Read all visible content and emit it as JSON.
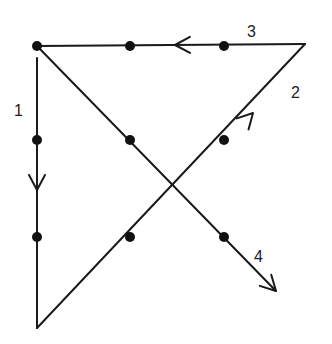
{
  "diagram": {
    "colors": {
      "line": "#1a1a1a",
      "dot": "#111111",
      "label": "#222222",
      "background": "#ffffff"
    },
    "dots": [
      {
        "x": 37,
        "y": 46
      },
      {
        "x": 130,
        "y": 46
      },
      {
        "x": 224,
        "y": 46
      },
      {
        "x": 37,
        "y": 140
      },
      {
        "x": 130,
        "y": 140
      },
      {
        "x": 224,
        "y": 140
      },
      {
        "x": 37,
        "y": 237
      },
      {
        "x": 130,
        "y": 237
      },
      {
        "x": 224,
        "y": 237
      }
    ],
    "segments": [
      {
        "label": "1",
        "from": {
          "x": 37,
          "y": 58
        },
        "to": {
          "x": 37,
          "y": 328
        },
        "arrow_at": {
          "x": 37,
          "y": 190
        },
        "direction": "down"
      },
      {
        "label": "2",
        "from": {
          "x": 37,
          "y": 328
        },
        "to": {
          "x": 305,
          "y": 44
        },
        "arrow_at": {
          "x": 253,
          "y": 113
        },
        "direction": "up-right"
      },
      {
        "label": "3",
        "from": {
          "x": 305,
          "y": 44
        },
        "to": {
          "x": 37,
          "y": 46
        },
        "arrow_at": {
          "x": 175,
          "y": 45
        },
        "direction": "left"
      },
      {
        "label": "4",
        "from": {
          "x": 37,
          "y": 46
        },
        "to": {
          "x": 276,
          "y": 291
        },
        "arrow_at": {
          "x": 276,
          "y": 291
        },
        "direction": "down-right"
      }
    ],
    "labels": [
      {
        "text": "1",
        "x": 14,
        "y": 116
      },
      {
        "text": "2",
        "x": 291,
        "y": 98
      },
      {
        "text": "3",
        "x": 247,
        "y": 37
      },
      {
        "text": "4",
        "x": 254,
        "y": 262
      }
    ]
  }
}
